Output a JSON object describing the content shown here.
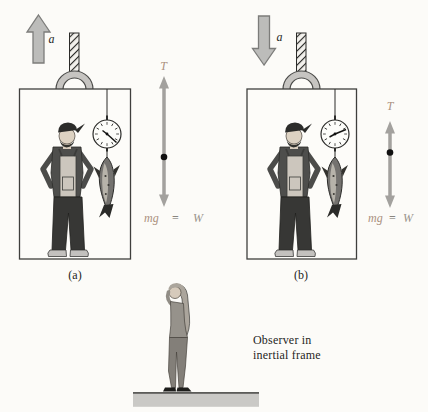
{
  "figure": {
    "panel_a": {
      "caption": "(a)",
      "accel_label": "a",
      "accel_direction": "up",
      "tension_label": "T",
      "weight_mg": "mg",
      "weight_eq": "=",
      "weight_w": "W"
    },
    "panel_b": {
      "caption": "(b)",
      "accel_label": "a",
      "accel_direction": "down",
      "tension_label": "T",
      "weight_mg": "mg",
      "weight_eq": "=",
      "weight_w": "W"
    },
    "observer_caption_line1": "Observer in",
    "observer_caption_line2": "inertial frame",
    "colors": {
      "background": "#fcfbf8",
      "accel_arrow_fill": "#bcbcba",
      "accel_arrow_stroke": "#7c7c7a",
      "vector_arrow": "#a3a19e",
      "vector_label_tan": "#ab9180",
      "weight_eq_ink": "#6e6a64",
      "weight_w_gray": "#99938c",
      "caption_ink": "#1f1f1d",
      "ground_fill": "#cac9c6",
      "box_stroke": "#3f3f3d"
    }
  }
}
